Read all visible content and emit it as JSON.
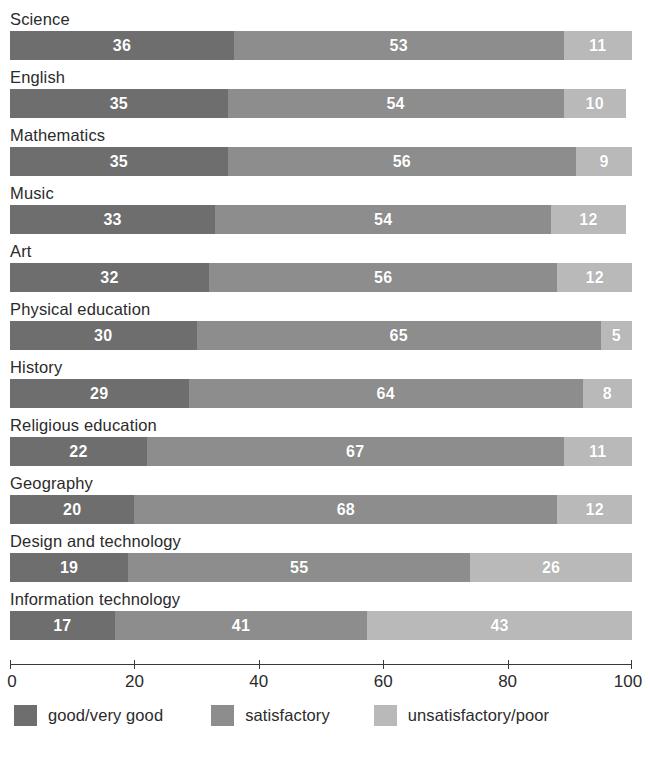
{
  "chart_data": {
    "type": "bar",
    "orientation": "horizontal",
    "stacked": true,
    "title": "",
    "xlabel": "",
    "ylabel": "",
    "xlim": [
      0,
      100
    ],
    "xticks": [
      0,
      20,
      40,
      60,
      80,
      100
    ],
    "xtick_labels": [
      "0",
      "20",
      "40",
      "60",
      "80",
      "100"
    ],
    "grid": false,
    "legend_position": "bottom-left",
    "categories": [
      "Science",
      "English",
      "Mathematics",
      "Music",
      "Art",
      "Physical education",
      "History",
      "Religious education",
      "Geography",
      "Design and technology",
      "Information technology"
    ],
    "series": [
      {
        "name": "good/very good",
        "color": "#6e6e6e",
        "values": [
          36,
          35,
          35,
          33,
          32,
          30,
          29,
          22,
          20,
          19,
          17
        ]
      },
      {
        "name": "satisfactory",
        "color": "#8d8d8d",
        "values": [
          53,
          54,
          56,
          54,
          56,
          65,
          64,
          67,
          68,
          55,
          41
        ]
      },
      {
        "name": "unsatisfactory/poor",
        "color": "#b9b9b9",
        "values": [
          11,
          10,
          9,
          12,
          12,
          5,
          8,
          11,
          12,
          26,
          43
        ]
      }
    ],
    "rows": [
      {
        "label": "Science",
        "values": [
          36,
          53,
          11
        ]
      },
      {
        "label": "English",
        "values": [
          35,
          54,
          10
        ]
      },
      {
        "label": "Mathematics",
        "values": [
          35,
          56,
          9
        ]
      },
      {
        "label": "Music",
        "values": [
          33,
          54,
          12
        ]
      },
      {
        "label": "Art",
        "values": [
          32,
          56,
          12
        ]
      },
      {
        "label": "Physical education",
        "values": [
          30,
          65,
          5
        ]
      },
      {
        "label": "History",
        "values": [
          29,
          64,
          8
        ]
      },
      {
        "label": "Religious education",
        "values": [
          22,
          67,
          11
        ]
      },
      {
        "label": "Geography",
        "values": [
          20,
          68,
          12
        ]
      },
      {
        "label": "Design and technology",
        "values": [
          19,
          55,
          26
        ]
      },
      {
        "label": "Information technology",
        "values": [
          17,
          41,
          43
        ]
      }
    ],
    "legend": [
      {
        "label": "good/very good",
        "color": "#6e6e6e"
      },
      {
        "label": "satisfactory",
        "color": "#8d8d8d"
      },
      {
        "label": "unsatisfactory/poor",
        "color": "#b9b9b9"
      }
    ],
    "axis_color": "#3a3a3a"
  }
}
